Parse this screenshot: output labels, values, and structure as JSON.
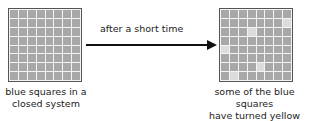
{
  "left_panel": {
    "caption_line1": "blue squares in a",
    "caption_line2": "closed system",
    "grid": {
      "rows": 8,
      "cols": 8,
      "changed_cells": []
    }
  },
  "arrow": {
    "label": "after a short time",
    "direction": "right"
  },
  "right_panel": {
    "caption_line1": "some of the blue squares",
    "caption_line2": "have turned yellow",
    "grid": {
      "rows": 8,
      "cols": 8,
      "changed_cells": [
        [
          1,
          7
        ],
        [
          2,
          3
        ],
        [
          4,
          0
        ],
        [
          6,
          4
        ],
        [
          7,
          1
        ]
      ]
    }
  },
  "colors": {
    "blue_square": "#a8a8a8",
    "yellow_square": "#dcdcdc",
    "grid_lines": "#f4f4f4",
    "border": "#555555",
    "arrow": "#111111"
  }
}
